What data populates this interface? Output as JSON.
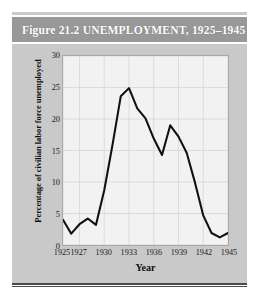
{
  "figure": {
    "title": "Figure 21.2  UNEMPLOYMENT, 1925–1945",
    "panel_color": "#c9c9c9",
    "title_bar_color": "#989898",
    "title_text_color": "#fdfdfd",
    "line_color": "#111111",
    "plot_background": "#f2f2f2"
  },
  "chart_data": {
    "type": "line",
    "title": "Figure 21.2  UNEMPLOYMENT, 1925–1945",
    "xlabel": "Year",
    "ylabel": "Percentage of civilian labor force unemployed",
    "xlim": [
      1925,
      1945
    ],
    "ylim": [
      0,
      30
    ],
    "xticks": [
      "1925",
      "1927",
      "1930",
      "1933",
      "1936",
      "1939",
      "1942",
      "1945"
    ],
    "xtick_values": [
      1925,
      1927,
      1930,
      1933,
      1936,
      1939,
      1942,
      1945
    ],
    "yticks": [
      "0",
      "5",
      "10",
      "15",
      "20",
      "25",
      "30"
    ],
    "ytick_values": [
      0,
      5,
      10,
      15,
      20,
      25,
      30
    ],
    "grid": true,
    "legend": "none",
    "x": [
      1925,
      1926,
      1927,
      1928,
      1929,
      1930,
      1931,
      1932,
      1933,
      1934,
      1935,
      1936,
      1937,
      1938,
      1939,
      1940,
      1941,
      1942,
      1943,
      1944,
      1945
    ],
    "values": [
      4.0,
      1.8,
      3.3,
      4.2,
      3.2,
      8.7,
      15.9,
      23.6,
      24.9,
      21.7,
      20.1,
      16.9,
      14.3,
      19.0,
      17.2,
      14.6,
      9.9,
      4.7,
      1.9,
      1.2,
      1.9
    ],
    "series": [
      {
        "name": "Percentage of civilian labor force unemployed",
        "values": [
          4.0,
          1.8,
          3.3,
          4.2,
          3.2,
          8.7,
          15.9,
          23.6,
          24.9,
          21.7,
          20.1,
          16.9,
          14.3,
          19.0,
          17.2,
          14.6,
          9.9,
          4.7,
          1.9,
          1.2,
          1.9
        ]
      }
    ]
  }
}
